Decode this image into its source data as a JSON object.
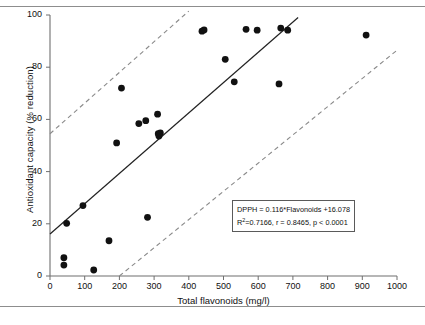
{
  "chart_data": {
    "type": "scatter",
    "title": "",
    "xlabel": "Total flavonoids (mg/l)",
    "ylabel": "Antioxidant capacity (% reduction)",
    "xlim": [
      0,
      1000
    ],
    "ylim": [
      0,
      100
    ],
    "xticks": [
      0,
      100,
      200,
      300,
      400,
      500,
      600,
      700,
      800,
      900,
      1000
    ],
    "yticks": [
      0,
      20,
      40,
      60,
      80,
      100
    ],
    "grid": false,
    "legend": null,
    "points": [
      {
        "x": 40,
        "y": 7.0
      },
      {
        "x": 40,
        "y": 4.2
      },
      {
        "x": 48,
        "y": 20.2
      },
      {
        "x": 95,
        "y": 27.0
      },
      {
        "x": 126,
        "y": 2.3
      },
      {
        "x": 170,
        "y": 13.5
      },
      {
        "x": 192,
        "y": 51.0
      },
      {
        "x": 206,
        "y": 72.0
      },
      {
        "x": 256,
        "y": 58.4
      },
      {
        "x": 276,
        "y": 59.5
      },
      {
        "x": 281,
        "y": 22.5
      },
      {
        "x": 310,
        "y": 62.0
      },
      {
        "x": 312,
        "y": 54.5
      },
      {
        "x": 314,
        "y": 53.6
      },
      {
        "x": 318,
        "y": 54.8
      },
      {
        "x": 438,
        "y": 93.8
      },
      {
        "x": 444,
        "y": 94.3
      },
      {
        "x": 505,
        "y": 83.0
      },
      {
        "x": 531,
        "y": 74.4
      },
      {
        "x": 565,
        "y": 94.5
      },
      {
        "x": 597,
        "y": 94.2
      },
      {
        "x": 660,
        "y": 73.6
      },
      {
        "x": 665,
        "y": 95.0
      },
      {
        "x": 685,
        "y": 94.2
      },
      {
        "x": 911,
        "y": 92.3
      }
    ],
    "regression_line": {
      "style": "solid",
      "slope": 0.116,
      "intercept": 16.078,
      "x_start": 0,
      "x_end": 715
    },
    "confidence_bands": [
      {
        "name": "upper-prediction-band",
        "style": "dashed",
        "x_start": 0,
        "y_start": 54.5,
        "x_end": 400,
        "y_end": 101.5
      },
      {
        "name": "lower-prediction-band",
        "style": "dashed",
        "x_start": 200,
        "y_start": 0,
        "x_end": 1000,
        "y_end": 86.5
      }
    ],
    "annotation": {
      "line1": "DPPH = 0.116*Flavonoids +16.078",
      "line2_prefix": "R",
      "line2_sup": "2",
      "line2_rest": "=0.7166, r = 0.8465, p < 0.0001"
    },
    "marker": {
      "shape": "circle",
      "color": "#111111",
      "size": 3.4
    }
  }
}
